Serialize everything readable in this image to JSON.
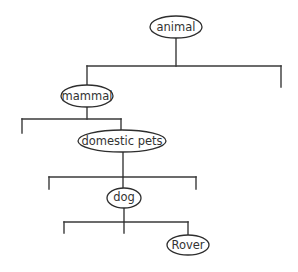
{
  "diagram": {
    "type": "tree",
    "colors": {
      "line": "#3a3a3a",
      "node_border": "#2e2e2e",
      "text": "#333333",
      "background": "#ffffff"
    },
    "nodes": [
      {
        "id": "animal",
        "label": "animal",
        "cx": 176,
        "cy": 27,
        "rx": 26,
        "ry": 11
      },
      {
        "id": "mammal",
        "label": "mammal",
        "cx": 87,
        "cy": 96,
        "rx": 26,
        "ry": 11
      },
      {
        "id": "domestic-pets",
        "label": "domestic pets",
        "cx": 122,
        "cy": 141,
        "rx": 44,
        "ry": 11
      },
      {
        "id": "dog",
        "label": "dog",
        "cx": 124,
        "cy": 198,
        "rx": 17,
        "ry": 10
      },
      {
        "id": "rover",
        "label": "Rover",
        "cx": 188,
        "cy": 245,
        "rx": 21,
        "ry": 10
      }
    ],
    "edges": [
      {
        "from": "animal",
        "to": "mammal"
      },
      {
        "from": "animal",
        "to": "(unlabeled branch)"
      },
      {
        "from": "mammal",
        "to": "(unlabeled branch)"
      },
      {
        "from": "mammal",
        "to": "domestic-pets"
      },
      {
        "from": "domestic-pets",
        "to": "(unlabeled branch)"
      },
      {
        "from": "domestic-pets",
        "to": "dog"
      },
      {
        "from": "domestic-pets",
        "to": "(unlabeled branch)"
      },
      {
        "from": "dog",
        "to": "(unlabeled branch)"
      },
      {
        "from": "dog",
        "to": "(unlabeled branch)"
      },
      {
        "from": "dog",
        "to": "rover"
      }
    ]
  }
}
